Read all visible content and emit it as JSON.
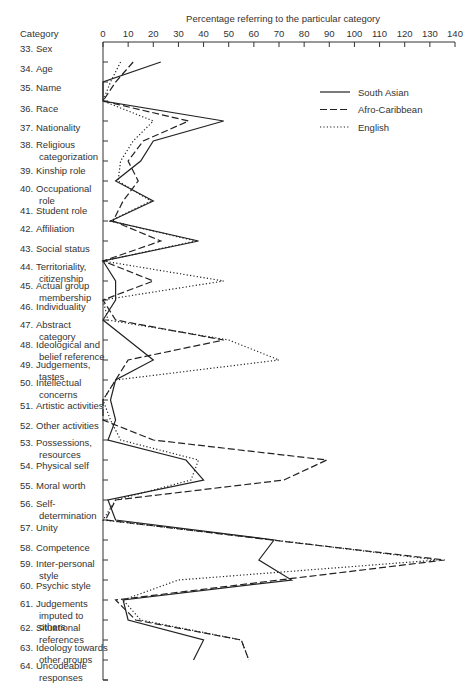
{
  "chart_data": {
    "type": "line",
    "orientation": "horizontal-values-vertical-categories",
    "title": "Percentage referring to the particular category",
    "xlabel": "Percentage referring to the particular category",
    "ylabel": "Category",
    "xlim": [
      0,
      140
    ],
    "xticks": [
      0,
      10,
      20,
      30,
      40,
      50,
      60,
      70,
      80,
      90,
      100,
      110,
      120,
      130,
      140
    ],
    "grid": false,
    "legend_position": "upper right",
    "categories": [
      {
        "label": [
          "33.",
          "Sex"
        ]
      },
      {
        "label": [
          "34.",
          "Age"
        ]
      },
      {
        "label": [
          "35.",
          "Name"
        ]
      },
      {
        "label": [
          "36.",
          "Race"
        ]
      },
      {
        "label": [
          "37.",
          "Nationality"
        ]
      },
      {
        "label": [
          "38.",
          "Religious",
          "categorization"
        ]
      },
      {
        "label": [
          "39.",
          "Kinship role"
        ]
      },
      {
        "label": [
          "40.",
          "Occupational",
          "role"
        ]
      },
      {
        "label": [
          "41.",
          "Student role"
        ]
      },
      {
        "label": [
          "42.",
          "Affiliation"
        ]
      },
      {
        "label": [
          "43.",
          "Social status"
        ]
      },
      {
        "label": [
          "44.",
          "Territoriality,",
          "citizenship"
        ]
      },
      {
        "label": [
          "45.",
          "Actual group",
          "membership"
        ]
      },
      {
        "label": [
          "46.",
          "Individuality"
        ]
      },
      {
        "label": [
          "47.",
          "Abstract",
          "category"
        ]
      },
      {
        "label": [
          "48.",
          "Ideological and",
          "belief reference"
        ]
      },
      {
        "label": [
          "49.",
          "Judgements,",
          "tastes"
        ]
      },
      {
        "label": [
          "50.",
          "Intellectual",
          "concerns"
        ]
      },
      {
        "label": [
          "51.",
          "Artistic activities"
        ]
      },
      {
        "label": [
          "52.",
          "Other activities"
        ]
      },
      {
        "label": [
          "53.",
          "Possessions,",
          "resources"
        ]
      },
      {
        "label": [
          "54.",
          "Physical self"
        ]
      },
      {
        "label": [
          "55.",
          "Moral worth"
        ]
      },
      {
        "label": [
          "56.",
          "Self-",
          "determination"
        ]
      },
      {
        "label": [
          "57.",
          "Unity"
        ]
      },
      {
        "label": [
          "58.",
          "Competence"
        ]
      },
      {
        "label": [
          "59.",
          "Inter-personal",
          "style"
        ]
      },
      {
        "label": [
          "60.",
          "Psychic style"
        ]
      },
      {
        "label": [
          "61.",
          "Judgements",
          "imputed to",
          "others"
        ]
      },
      {
        "label": [
          "62.",
          "Situational",
          "references"
        ]
      },
      {
        "label": [
          "63.",
          "Ideology towards",
          "other groups"
        ]
      },
      {
        "label": [
          "64.",
          "Uncodeable",
          "responses"
        ]
      }
    ],
    "label_y": [
      52,
      72,
      91,
      112,
      131,
      148,
      174,
      192,
      214,
      232,
      252,
      270,
      289,
      310,
      328,
      348,
      368,
      386,
      409,
      429,
      446,
      469,
      489,
      507,
      531,
      551,
      567,
      589,
      607,
      631,
      651,
      669
    ],
    "point_y": [
      62,
      82,
      101,
      121,
      141,
      161,
      181,
      201,
      221,
      241,
      261,
      281,
      300,
      320,
      340,
      360,
      380,
      400,
      420,
      440,
      460,
      480,
      500,
      520,
      540,
      560,
      580,
      600,
      620,
      640,
      660,
      680
    ],
    "series": [
      {
        "name": "South Asian",
        "style": "solid",
        "points": [
          [
            23,
            62
          ],
          [
            0,
            82
          ],
          [
            0,
            101
          ],
          [
            10,
            121
          ],
          [
            48,
            141
          ],
          [
            20,
            161
          ],
          [
            15,
            181
          ],
          [
            5,
            201
          ],
          [
            20,
            221
          ],
          [
            3,
            241
          ],
          [
            0,
            221
          ],
          [
            38,
            241
          ],
          [
            0,
            261
          ],
          [
            3,
            281
          ],
          [
            5,
            300
          ],
          [
            0,
            320
          ],
          [
            5,
            340
          ],
          [
            3,
            350
          ],
          [
            10,
            360
          ],
          [
            18,
            380
          ],
          [
            20,
            400
          ],
          [
            5,
            420
          ],
          [
            3,
            440
          ],
          [
            5,
            460
          ],
          [
            2,
            480
          ],
          [
            33,
            500
          ],
          [
            40,
            520
          ],
          [
            2,
            540
          ],
          [
            5,
            560
          ],
          [
            68,
            590
          ],
          [
            62,
            610
          ],
          [
            75,
            630
          ],
          [
            8,
            650
          ],
          [
            10,
            670
          ],
          [
            40,
            688
          ],
          [
            36,
            700
          ]
        ],
        "values_by_category": [
          null,
          23,
          0,
          0,
          48,
          20,
          15,
          5,
          20,
          3,
          38,
          0,
          5,
          5,
          0,
          10,
          20,
          5,
          3,
          5,
          2,
          33,
          40,
          2,
          5,
          68,
          62,
          75,
          8,
          10,
          40,
          36
        ]
      },
      {
        "name": "Afro-Caribbean",
        "style": "dashed",
        "points": [
          [
            12,
            62
          ],
          [
            5,
            82
          ],
          [
            0,
            101
          ],
          [
            34,
            121
          ],
          [
            16,
            141
          ],
          [
            10,
            161
          ],
          [
            14,
            181
          ],
          [
            8,
            201
          ],
          [
            4,
            221
          ],
          [
            4,
            241
          ],
          [
            0,
            221
          ],
          [
            23,
            241
          ],
          [
            0,
            261
          ],
          [
            0,
            281
          ],
          [
            20,
            300
          ],
          [
            0,
            320
          ],
          [
            5,
            340
          ],
          [
            0,
            350
          ],
          [
            48,
            360
          ],
          [
            10,
            380
          ],
          [
            5,
            400
          ],
          [
            0,
            420
          ],
          [
            0,
            440
          ],
          [
            0,
            460
          ],
          [
            20,
            480
          ],
          [
            89,
            481
          ],
          [
            72,
            500
          ],
          [
            5,
            520
          ],
          [
            1,
            540
          ],
          [
            5,
            560
          ],
          [
            67,
            590
          ],
          [
            136,
            610
          ],
          [
            70,
            630
          ],
          [
            5,
            650
          ],
          [
            13,
            670
          ],
          [
            55,
            688
          ],
          [
            58,
            700
          ]
        ],
        "values_by_category": [
          null,
          12,
          5,
          0,
          34,
          16,
          10,
          14,
          8,
          4,
          23,
          0,
          20,
          0,
          5,
          48,
          10,
          5,
          0,
          0,
          20,
          89,
          72,
          5,
          1,
          67,
          136,
          70,
          5,
          13,
          55,
          58
        ]
      },
      {
        "name": "English",
        "style": "dotted",
        "points": [
          [
            7,
            62
          ],
          [
            3,
            82
          ],
          [
            0,
            101
          ],
          [
            20,
            121
          ],
          [
            12,
            141
          ],
          [
            7,
            161
          ],
          [
            6,
            181
          ],
          [
            19,
            201
          ],
          [
            12,
            221
          ],
          [
            3,
            241
          ],
          [
            0,
            221
          ],
          [
            37,
            241
          ],
          [
            0,
            261
          ],
          [
            0,
            281
          ],
          [
            48,
            300
          ],
          [
            0,
            320
          ],
          [
            2,
            340
          ],
          [
            0,
            350
          ],
          [
            70,
            380
          ],
          [
            0,
            420
          ],
          [
            3,
            440
          ],
          [
            7,
            460
          ],
          [
            7,
            480
          ],
          [
            38,
            500
          ],
          [
            5,
            520
          ],
          [
            0,
            540
          ],
          [
            5,
            560
          ],
          [
            68,
            590
          ],
          [
            133,
            610
          ],
          [
            30,
            630
          ],
          [
            8,
            650
          ],
          [
            15,
            670
          ],
          [
            55,
            688
          ]
        ],
        "values_by_category": [
          null,
          7,
          3,
          0,
          20,
          12,
          7,
          6,
          19,
          3,
          37,
          0,
          48,
          0,
          2,
          50,
          70,
          5,
          0,
          3,
          7,
          38,
          35,
          5,
          0,
          68,
          133,
          30,
          8,
          15,
          55,
          58
        ]
      }
    ]
  },
  "legend": {
    "items": [
      {
        "label": "South Asian",
        "style": "solid"
      },
      {
        "label": "Afro-Caribbean",
        "style": "dashed"
      },
      {
        "label": "English",
        "style": "dotted"
      }
    ]
  },
  "axis": {
    "x_title": "Percentage referring to the particular category",
    "y_title": "Category"
  }
}
